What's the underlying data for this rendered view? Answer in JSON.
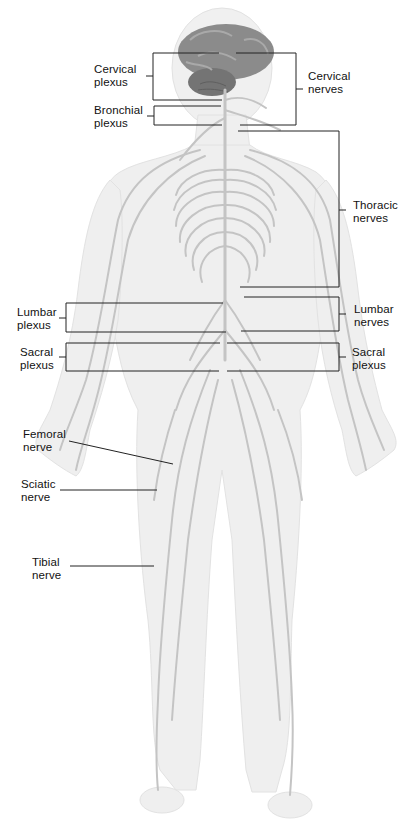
{
  "figure": {
    "colors": {
      "background": "#ffffff",
      "body_fill": "#efefef",
      "body_shade": "#e4e4e4",
      "nerve": "#c6c6c6",
      "brain": "#8a8a8a",
      "brain_dark": "#6f6f6f",
      "leader_line": "#222222"
    }
  },
  "labels": {
    "cervical_plexus": {
      "line1": "Cervical",
      "line2": "plexus"
    },
    "bronchial_plexus": {
      "line1": "Bronchial",
      "line2": "plexus"
    },
    "cervical_nerves": {
      "line1": "Cervical",
      "line2": "nerves"
    },
    "thoracic_nerves": {
      "line1": "Thoracic",
      "line2": "nerves"
    },
    "lumbar_plexus": {
      "line1": "Lumbar",
      "line2": "plexus"
    },
    "lumbar_nerves": {
      "line1": "Lumbar",
      "line2": "nerves"
    },
    "sacral_plexus_left": {
      "line1": "Sacral",
      "line2": "plexus"
    },
    "sacral_plexus_right": {
      "line1": "Sacral",
      "line2": "plexus"
    },
    "femoral_nerve": {
      "line1": "Femoral",
      "line2": "nerve"
    },
    "sciatic_nerve": {
      "line1": "Sciatic",
      "line2": "nerve"
    },
    "tibial_nerve": {
      "line1": "Tibial",
      "line2": "nerve"
    }
  }
}
